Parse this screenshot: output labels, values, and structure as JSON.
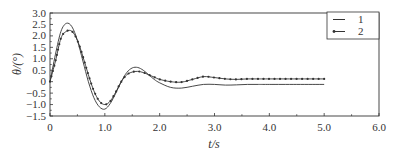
{
  "chart_data": {
    "type": "line",
    "title": "",
    "xlabel": "t/s",
    "ylabel": "θ/(°)",
    "xlim": [
      0,
      6.0
    ],
    "ylim": [
      -1.5,
      3.0
    ],
    "xticks": [
      "0",
      "1.0",
      "2.0",
      "3.0",
      "4.0",
      "5.0",
      "6.0"
    ],
    "yticks": [
      "3.0",
      "2.5",
      "2.0",
      "1.5",
      "1.0",
      "0.5",
      "0",
      "-0.5",
      "-1.0",
      "-1.5"
    ],
    "grid": false,
    "legend_position": "upper right",
    "series": [
      {
        "name": "1",
        "marker": "none",
        "x": [
          0,
          0.1,
          0.2,
          0.3,
          0.4,
          0.5,
          0.6,
          0.7,
          0.8,
          0.9,
          1.0,
          1.1,
          1.2,
          1.3,
          1.4,
          1.5,
          1.6,
          1.7,
          1.8,
          1.9,
          2.0,
          2.2,
          2.4,
          2.6,
          2.8,
          3.0,
          3.2,
          3.4,
          3.6,
          3.8,
          4.0,
          4.5,
          5.0
        ],
        "values": [
          0,
          1.2,
          2.2,
          2.55,
          2.4,
          1.8,
          0.9,
          0.0,
          -0.7,
          -1.1,
          -1.2,
          -0.95,
          -0.5,
          0.0,
          0.4,
          0.6,
          0.62,
          0.5,
          0.3,
          0.1,
          -0.05,
          -0.25,
          -0.28,
          -0.2,
          -0.12,
          -0.12,
          -0.15,
          -0.14,
          -0.12,
          -0.12,
          -0.12,
          -0.12,
          -0.12
        ]
      },
      {
        "name": "2",
        "marker": "dot",
        "x": [
          0,
          0.1,
          0.2,
          0.3,
          0.4,
          0.5,
          0.6,
          0.7,
          0.8,
          0.9,
          1.0,
          1.1,
          1.2,
          1.3,
          1.4,
          1.5,
          1.6,
          1.7,
          1.8,
          1.9,
          2.0,
          2.2,
          2.4,
          2.6,
          2.8,
          3.0,
          3.2,
          3.4,
          3.6,
          3.8,
          4.0,
          4.5,
          5.0
        ],
        "values": [
          0,
          0.9,
          1.9,
          2.2,
          2.2,
          1.8,
          1.1,
          0.3,
          -0.4,
          -0.85,
          -1.0,
          -0.85,
          -0.45,
          0.0,
          0.3,
          0.42,
          0.45,
          0.4,
          0.3,
          0.2,
          0.1,
          0.0,
          -0.02,
          0.1,
          0.22,
          0.18,
          0.12,
          0.1,
          0.12,
          0.12,
          0.12,
          0.12,
          0.12
        ]
      }
    ],
    "legend": [
      "1",
      "2"
    ]
  },
  "colors": {
    "line": "#333333",
    "axis": "#333333"
  }
}
